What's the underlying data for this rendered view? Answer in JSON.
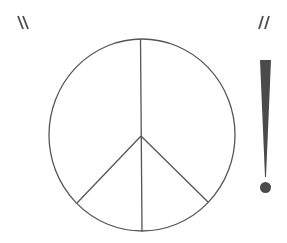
{
  "colors": {
    "background": "#ffffff",
    "stroke": "#555555",
    "fill": "#4a4a4a",
    "tick_marks": "#4d4d4d"
  },
  "elements": {
    "left_marks": "backslash-pair",
    "right_marks": "slash-pair",
    "center_symbol": "peace-symbol",
    "right_symbol": "exclamation-mark"
  }
}
